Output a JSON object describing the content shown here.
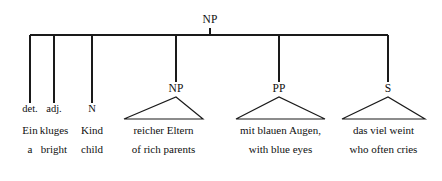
{
  "diagram": {
    "root": {
      "label": "NP",
      "x": 210,
      "y": 20
    },
    "colors": {
      "line": "#1a1a1a",
      "text": "#101010",
      "background": "#ffffff"
    },
    "bar": {
      "y": 35,
      "x_start": 30,
      "x_end": 388
    },
    "branches": [
      {
        "kind": "terminal",
        "pos": "det.",
        "word": "Ein",
        "gloss": "a",
        "x": 30,
        "stem_bottom": 103
      },
      {
        "kind": "terminal",
        "pos": "adj.",
        "word": "kluges",
        "gloss": "bright",
        "x": 54,
        "stem_bottom": 103
      },
      {
        "kind": "terminal",
        "pos": "N",
        "word": "Kind",
        "gloss": "child",
        "x": 92,
        "stem_bottom": 103
      },
      {
        "kind": "triangle",
        "label": "NP",
        "word": "reicher Eltern",
        "gloss": "of rich parents",
        "x": 176,
        "stem_bottom": 82,
        "apex_y": 97,
        "base_y": 119,
        "base_left": 124,
        "base_right": 203
      },
      {
        "kind": "triangle",
        "label": "PP",
        "word": "mit blauen Augen,",
        "gloss": "with blue eyes",
        "x": 279,
        "stem_bottom": 82,
        "apex_y": 97,
        "base_y": 119,
        "base_left": 236,
        "base_right": 325
      },
      {
        "kind": "triangle",
        "label": "S",
        "word": "das viel weint",
        "gloss": "who often cries",
        "x": 388,
        "stem_bottom": 82,
        "apex_y": 97,
        "base_y": 119,
        "base_left": 342,
        "base_right": 425
      }
    ],
    "rows": {
      "pos_label_y": 112,
      "word_y": 133,
      "gloss_y": 152
    }
  }
}
